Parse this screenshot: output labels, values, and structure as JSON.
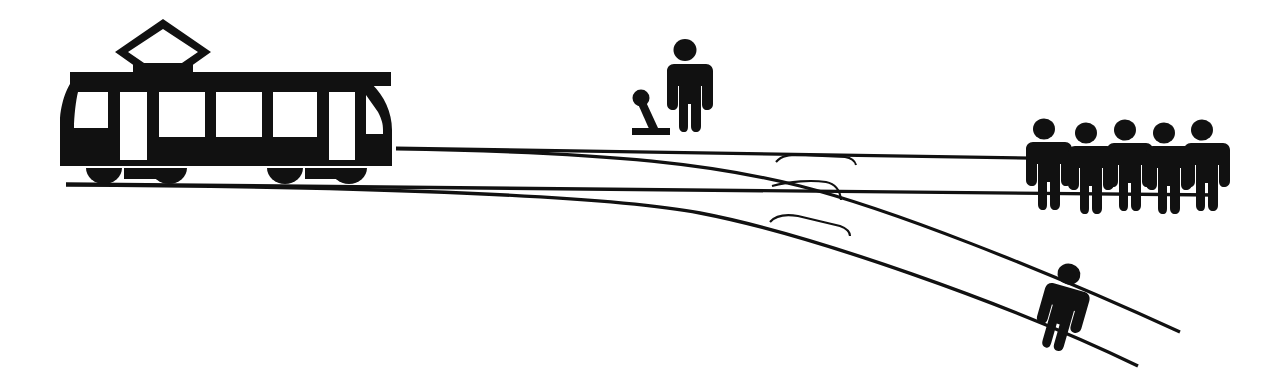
{
  "diagram": {
    "type": "schematic-illustration",
    "canvas": {
      "width": 1268,
      "height": 382
    },
    "colors": {
      "ink": "#111111",
      "background": "#ffffff"
    },
    "style": "black-and-white pictogram line art"
  },
  "elements": {
    "tram": {
      "label": "tram",
      "icon": "tram-icon",
      "position": {
        "x": 60,
        "y": 18,
        "width": 345,
        "height": 170
      },
      "direction": "travelling right",
      "parts": {
        "pantograph": "diamond-pantograph",
        "roof": "roof-bar",
        "windows_count": 3,
        "door_windows_count": 2,
        "windshields_count": 2,
        "bogies_count": 2,
        "wheels_per_bogie": 2
      }
    },
    "bystander": {
      "label": "bystander at the switch",
      "icon": "person-icon",
      "position": {
        "x": 665,
        "y": 40,
        "width": 42,
        "height": 92
      },
      "orientation": "upright"
    },
    "switch_lever": {
      "label": "track switch lever",
      "icon": "lever-icon",
      "position": {
        "x": 630,
        "y": 92,
        "width": 40,
        "height": 42
      },
      "state": "tilted left"
    },
    "group_of_five": {
      "label": "five people on the main track",
      "icon": "person-group-icon",
      "count": 5,
      "position": {
        "x": 1022,
        "y": 118,
        "width": 185,
        "height": 95
      },
      "orientation": "upright",
      "on_track": "main-track"
    },
    "lone_person": {
      "label": "one person on the side track",
      "icon": "person-icon",
      "count": 1,
      "position": {
        "x": 1045,
        "y": 255,
        "width": 60,
        "height": 85
      },
      "orientation": "tilted along the diagonal rail",
      "on_track": "branch-track"
    },
    "tracks": {
      "main_track": {
        "label": "main track (straight ahead)",
        "rails": 2,
        "leads_to": "five people"
      },
      "branch_track": {
        "label": "branch track (diverted)",
        "rails": 2,
        "leads_to": "one person"
      },
      "switch_points": {
        "label": "switch point blades",
        "count": 3
      }
    }
  }
}
